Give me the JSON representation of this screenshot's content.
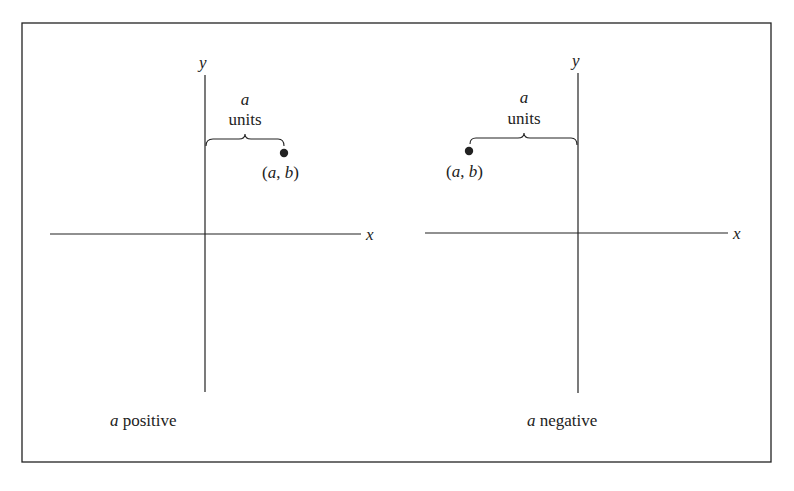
{
  "figure": {
    "panels": [
      {
        "id": "left",
        "axis_x_label": "x",
        "axis_y_label": "y",
        "distance_var": "a",
        "distance_unit": "units",
        "point_label_open": "(",
        "point_label_a": "a",
        "point_label_sep": ", ",
        "point_label_b": "b",
        "point_label_close": ")",
        "caption_var": "a",
        "caption_text": " positive"
      },
      {
        "id": "right",
        "axis_x_label": "x",
        "axis_y_label": "y",
        "distance_var": "a",
        "distance_unit": "units",
        "point_label_open": "(",
        "point_label_a": "a",
        "point_label_sep": ", ",
        "point_label_b": "b",
        "point_label_close": ")",
        "caption_var": "a",
        "caption_text": " negative"
      }
    ],
    "colors": {
      "ink": "#222222",
      "background": "#ffffff"
    }
  }
}
